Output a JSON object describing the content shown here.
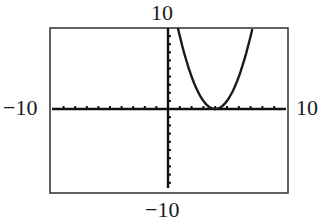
{
  "chart_data": {
    "type": "line",
    "title": "",
    "xlabel": "",
    "ylabel": "",
    "window": {
      "xmin": -10,
      "xmax": 10,
      "xscl": 1,
      "ymin": -10,
      "ymax": 10,
      "yscl": 1
    },
    "xlim": [
      -10,
      10
    ],
    "ylim": [
      -10,
      10
    ],
    "grid": false,
    "legend": null,
    "window_labels": {
      "top": "10",
      "bottom": "−10",
      "left": "−10",
      "right": "10"
    },
    "series": [
      {
        "name": "f(x)",
        "approx_function": "(x - 4)^2",
        "vertex": [
          4,
          0
        ],
        "x": [
          0.84,
          1,
          1.5,
          2,
          2.5,
          3,
          3.5,
          4,
          4.5,
          5,
          5.5,
          6,
          6.5,
          7,
          7.16
        ],
        "y": [
          10,
          9,
          6.25,
          4,
          2.25,
          1,
          0.25,
          0,
          0.25,
          1,
          2.25,
          4,
          6.25,
          9,
          10
        ]
      }
    ]
  },
  "colors": {
    "background": "#ffffff",
    "frame": "#3a3a3a",
    "axes": "#111111",
    "curve": "#1a1a1a",
    "text": "#1a1a1a"
  }
}
